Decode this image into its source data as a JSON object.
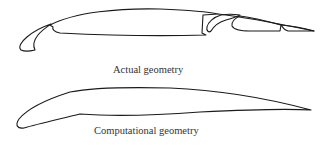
{
  "figure": {
    "panels": [
      {
        "id": "actual",
        "label": "Actual geometry",
        "components": [
          "leading-edge slat",
          "main element",
          "flap 1",
          "flap 2",
          "flap 3"
        ]
      },
      {
        "id": "computational",
        "label": "Computational geometry",
        "components": [
          "single-element simplified airfoil"
        ]
      }
    ],
    "stroke_color": "#1a1a1a",
    "background": "#ffffff"
  }
}
